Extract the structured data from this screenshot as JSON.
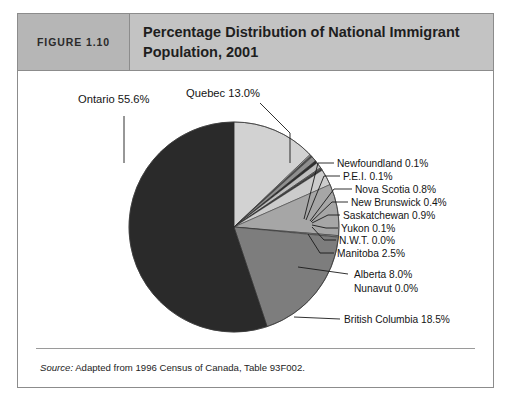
{
  "figure": {
    "number_label": "FIGURE 1.10",
    "title": "Percentage Distribution of National Immigrant Population, 2001",
    "source_lead": "Source:",
    "source_text": " Adapted from 1996 Census of Canada, Table 93F002."
  },
  "chart_data": {
    "type": "pie",
    "title": "Percentage Distribution of National Immigrant Population, 2001",
    "unit": "percent",
    "total": 100.0,
    "start_angle_deg": 0,
    "direction": "clockwise",
    "categories": [
      "Quebec",
      "Newfoundland",
      "P.E.I.",
      "Nova Scotia",
      "New Brunswick",
      "Saskatchewan",
      "Yukon",
      "N.W.T.",
      "Manitoba",
      "Alberta",
      "Nunavut",
      "British Columbia",
      "Ontario"
    ],
    "values": [
      13.0,
      0.1,
      0.1,
      0.8,
      0.4,
      0.9,
      0.1,
      0.0,
      2.5,
      8.0,
      0.0,
      18.5,
      55.6
    ],
    "slices": [
      {
        "label": "Quebec",
        "value": 13.0,
        "text": "Quebec  13.0%",
        "color": "#d2d2d2"
      },
      {
        "label": "Newfoundland",
        "value": 0.1,
        "text": "Newfoundland 0.1%",
        "color": "#9a9a9a"
      },
      {
        "label": "P.E.I.",
        "value": 0.1,
        "text": "P.E.I.  0.1%",
        "color": "#4a4a4a"
      },
      {
        "label": "Nova Scotia",
        "value": 0.8,
        "text": "Nova Scotia  0.8%",
        "color": "#8f8f8f"
      },
      {
        "label": "New Brunswick",
        "value": 0.4,
        "text": "New Brunswick 0.4%",
        "color": "#2f2f2f"
      },
      {
        "label": "Saskatchewan",
        "value": 0.9,
        "text": "Saskatchewan 0.9%",
        "color": "#bdbdbd"
      },
      {
        "label": "Yukon",
        "value": 0.1,
        "text": "Yukon 0.1%",
        "color": "#5c5c5c"
      },
      {
        "label": "N.W.T.",
        "value": 0.0,
        "text": "N.W.T.  0.0%",
        "color": "#3a3a3a"
      },
      {
        "label": "Manitoba",
        "value": 2.5,
        "text": "Manitoba  2.5%",
        "color": "#cccccc"
      },
      {
        "label": "Alberta",
        "value": 8.0,
        "text": "Alberta 8.0%",
        "color": "#a6a6a6"
      },
      {
        "label": "Nunavut",
        "value": 0.0,
        "text": "Nunavut 0.0%",
        "color": "#8a8a8a"
      },
      {
        "label": "British Columbia",
        "value": 18.5,
        "text": "British Columbia 18.5%",
        "color": "#7d7d7d"
      },
      {
        "label": "Ontario",
        "value": 55.6,
        "text": "Ontario  55.6%",
        "color": "#2a2a2a"
      }
    ],
    "legend": "none",
    "grid": false
  }
}
